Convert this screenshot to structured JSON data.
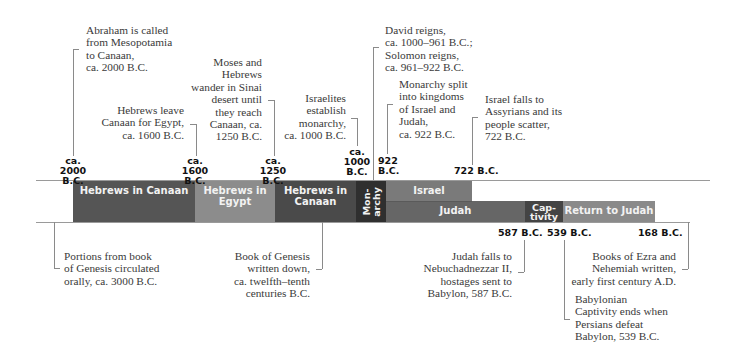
{
  "timeline": {
    "top_events": [
      {
        "id": "abraham",
        "text": "Abraham is called\nfrom Mesopotamia\nto Canaan,\nca. 2000 B.C."
      },
      {
        "id": "leave-canaan",
        "text": "Hebrews leave\nCanaan for Egypt,\nca. 1600 B.C."
      },
      {
        "id": "moses",
        "text": "Moses and\nHebrews\nwander in Sinai\ndesert until\nthey reach\nCanaan, ca.\n1250 B.C."
      },
      {
        "id": "monarchy",
        "text": "Israelites\nestablish\nmonarchy,\nca. 1000 B.C."
      },
      {
        "id": "david",
        "text": "David reigns,\nca. 1000–961 B.C.;\nSolomon reigns,\nca. 961–922 B.C."
      },
      {
        "id": "split",
        "text": "Monarchy split\ninto kingdoms\nof Israel and\nJudah,\nca. 922 B.C."
      },
      {
        "id": "israel-falls",
        "text": "Israel falls to\nAssyrians and its\npeople scatter,\n722 B.C."
      }
    ],
    "top_dates": [
      {
        "id": "d2000",
        "text": "ca.\n2000 B.C."
      },
      {
        "id": "d1600",
        "text": "ca.\n1600 B.C."
      },
      {
        "id": "d1250",
        "text": "ca.\n1250 B.C."
      },
      {
        "id": "d1000",
        "text": "ca.\n1000\nB.C."
      },
      {
        "id": "d922",
        "text": "922\nB.C."
      },
      {
        "id": "d722",
        "text": "722 B.C."
      }
    ],
    "bars": [
      {
        "id": "hebrews-canaan-1",
        "label": "Hebrews in Canaan",
        "color": "#555555"
      },
      {
        "id": "hebrews-egypt",
        "label": "Hebrews in\nEgypt",
        "color": "#8c8c8c"
      },
      {
        "id": "hebrews-canaan-2",
        "label": "Hebrews in\nCanaan",
        "color": "#4a4a4a"
      },
      {
        "id": "monarchy",
        "label": "Mon-\narchy",
        "color": "#2f2f2f"
      },
      {
        "id": "israel",
        "label": "Israel",
        "color": "#7a7a7a"
      },
      {
        "id": "judah",
        "label": "Judah",
        "color": "#666666"
      },
      {
        "id": "captivity",
        "label": "Cap-\ntivity",
        "color": "#444444"
      },
      {
        "id": "return",
        "label": "Return to Judah",
        "color": "#8a8a8a"
      }
    ],
    "bottom_dates": [
      {
        "id": "d587",
        "text": "587 B.C."
      },
      {
        "id": "d539",
        "text": "539 B.C."
      },
      {
        "id": "d168",
        "text": "168 B.C."
      }
    ],
    "bottom_events": [
      {
        "id": "portions",
        "text": "Portions from book\nof Genesis circulated\norally, ca. 3000 B.C."
      },
      {
        "id": "genesis",
        "text": "Book of Genesis\nwritten down,\nca. twelfth–tenth\ncenturies B.C."
      },
      {
        "id": "judah-falls",
        "text": "Judah falls to\nNebuchadnezzar II,\nhostages sent to\nBabylon, 587 B.C."
      },
      {
        "id": "ezra",
        "text": "Books of Ezra and\nNehemiah written,\nearly first century A.D."
      },
      {
        "id": "captivity-ends",
        "text": "Babylonian\nCaptivity ends when\nPersians defeat\nBabylon, 539 B.C."
      }
    ]
  }
}
